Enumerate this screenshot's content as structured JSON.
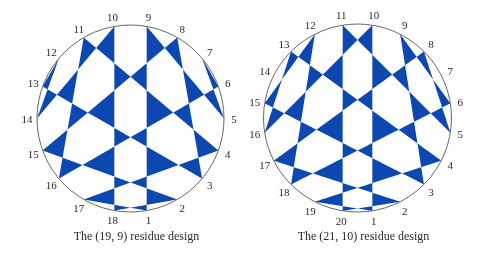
{
  "figure": {
    "fill_color": "#0d47b0",
    "circle_stroke_color": "#555555",
    "designs": [
      {
        "id": "design-19-9",
        "n": 19,
        "m": 9,
        "caption": "The (19, 9) residue design",
        "center": [
          130.5,
          118.5
        ],
        "radius": 93.5,
        "points": [
          "1",
          "2",
          "3",
          "4",
          "5",
          "6",
          "7",
          "8",
          "9",
          "10",
          "11",
          "12",
          "13",
          "14",
          "15",
          "16",
          "17",
          "18"
        ],
        "chords": [
          [
            1,
            9
          ],
          [
            2,
            18
          ],
          [
            3,
            8
          ],
          [
            4,
            17
          ],
          [
            5,
            7
          ],
          [
            6,
            16
          ],
          [
            7,
            6
          ],
          [
            8,
            15
          ],
          [
            9,
            5
          ],
          [
            10,
            14
          ],
          [
            11,
            4
          ],
          [
            12,
            13
          ],
          [
            13,
            3
          ],
          [
            14,
            12
          ],
          [
            15,
            2
          ],
          [
            16,
            11
          ],
          [
            17,
            1
          ],
          [
            18,
            10
          ]
        ]
      },
      {
        "id": "design-21-10",
        "n": 21,
        "m": 10,
        "caption": "The (21, 10) residue design",
        "center": [
          357.5,
          118.0
        ],
        "radius": 94.0,
        "points": [
          "1",
          "2",
          "3",
          "4",
          "5",
          "6",
          "7",
          "8",
          "9",
          "10",
          "11",
          "12",
          "13",
          "14",
          "15",
          "16",
          "17",
          "18",
          "19",
          "20"
        ],
        "chords": [
          [
            1,
            10
          ],
          [
            2,
            20
          ],
          [
            3,
            9
          ],
          [
            4,
            19
          ],
          [
            5,
            8
          ],
          [
            6,
            18
          ],
          [
            8,
            17
          ],
          [
            9,
            6
          ],
          [
            10,
            16
          ],
          [
            11,
            5
          ],
          [
            12,
            15
          ],
          [
            13,
            4
          ],
          [
            15,
            3
          ],
          [
            16,
            13
          ],
          [
            17,
            2
          ],
          [
            18,
            12
          ],
          [
            19,
            1
          ],
          [
            20,
            11
          ]
        ]
      }
    ]
  }
}
